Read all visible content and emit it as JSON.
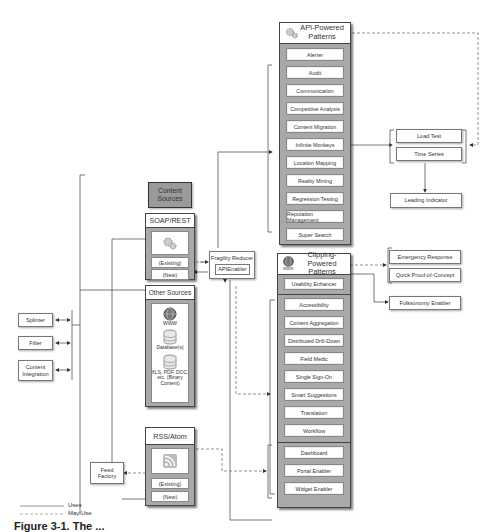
{
  "content_sources": {
    "title": "Content Sources",
    "soap_rest": {
      "title": "SOAP/REST",
      "icon": "gears-icon",
      "existing": "(Existing)",
      "new": "(New)"
    },
    "other_sources": {
      "title": "Other Sources",
      "items": [
        {
          "icon": "globe-icon",
          "label": "WWW"
        },
        {
          "icon": "database-icon",
          "label": "Database(s)"
        },
        {
          "icon": "database-icon",
          "label": "XLS, PDF, DOC, etc. (Binary Content)"
        }
      ]
    },
    "rss_atom": {
      "title": "RSS/Atom",
      "icon": "rss-feed-icon",
      "existing": "(Existing)",
      "new": "(New)"
    }
  },
  "fragility_reducer": {
    "title": "Fragility Reducer",
    "inner": "APIEnabler"
  },
  "feed_factory": "Feed Factory",
  "left_tools": [
    "Splinter",
    "Filter",
    "Content Integration"
  ],
  "api_powered": {
    "title": "API-Powered Patterns",
    "icon": "gears-icon",
    "items": [
      "Alerter",
      "Audit",
      "Communication",
      "Competitive Analysis",
      "Content Migration",
      "Infinite Monkeys",
      "Location Mapping",
      "Reality Mining",
      "Regression Testing",
      "Reputation Management",
      "Super Search"
    ]
  },
  "clipping_powered": {
    "title": "Clipping-Powered Patterns",
    "icon": "globe-icon",
    "icon_label": "WWW",
    "top_item": "Usability Enhancer",
    "items": [
      "Accessibility",
      "Content Aggregation",
      "Distributed Drill-Down",
      "Field Medic",
      "Single Sign-On",
      "Smart Suggestions",
      "Translation",
      "Workflow"
    ],
    "bottom_items": [
      "Dashboard",
      "Portal Enabler",
      "Widget Enabler"
    ]
  },
  "right_group_1": [
    "Load Test",
    "Time Series"
  ],
  "leading_indicator": "Leading Indicator",
  "right_group_2": [
    "Emergency Response",
    "Quick Proof-of-Concept"
  ],
  "folksonomy": "Folksonomy Enabler",
  "legend": {
    "uses": "Uses",
    "may_use": "May Use"
  },
  "caption": "Figure 3-1. The ..."
}
